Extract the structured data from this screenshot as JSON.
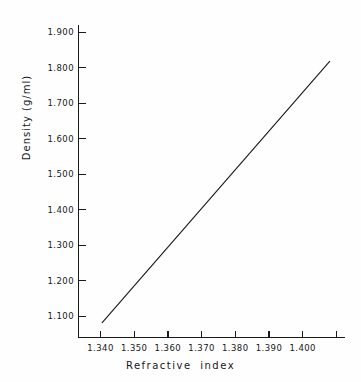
{
  "chart_data": {
    "type": "line",
    "title": "",
    "xlabel": "Refractive index",
    "ylabel": "Density (g/ml)",
    "xlim": [
      1.3335,
      1.4125
    ],
    "ylim": [
      1.0265,
      1.927
    ],
    "grid": false,
    "legend": null,
    "xticks": [
      1.34,
      1.35,
      1.36,
      1.37,
      1.38,
      1.39,
      1.4
    ],
    "xtick_labels": [
      "1.340",
      "1.350",
      "1.360",
      "1.370",
      "1.380",
      "1.390",
      "1.400"
    ],
    "yticks": [
      1.1,
      1.2,
      1.3,
      1.4,
      1.5,
      1.6,
      1.7,
      1.8,
      1.9
    ],
    "ytick_labels": [
      "1.100",
      "1.200",
      "1.300",
      "1.400",
      "1.500",
      "1.600",
      "1.700",
      "1.800",
      "1.900"
    ],
    "x": [
      1.3405,
      1.408
    ],
    "y": [
      1.082,
      1.818
    ],
    "series": [
      {
        "name": "Density vs Refractive index",
        "x": [
          1.3405,
          1.408
        ],
        "y": [
          1.082,
          1.818
        ],
        "color": "#1a1a1e",
        "linewidth": 1.1,
        "marker": "none"
      }
    ],
    "annotations": [],
    "axis_color": "#1a1a1e",
    "background": "#fefefe"
  },
  "axes": {
    "x_title": "Refractive index",
    "y_title": "Density (g/ml)"
  }
}
